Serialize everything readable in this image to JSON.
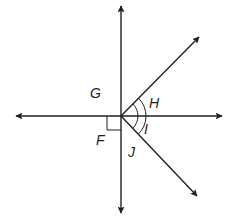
{
  "diagram": {
    "type": "geometry-angles",
    "colors": {
      "line": "#231f20",
      "background": "#ffffff"
    },
    "center": {
      "x": 121,
      "y": 116
    },
    "lines": [
      {
        "name": "vertical-line",
        "from": [
          121,
          5
        ],
        "to": [
          121,
          214
        ],
        "arrows": "both"
      },
      {
        "name": "horizontal-line",
        "from": [
          15,
          116
        ],
        "to": [
          222,
          116
        ],
        "arrows": "both"
      }
    ],
    "rays": [
      {
        "name": "upper-right-ray",
        "from": [
          121,
          116
        ],
        "to": [
          199,
          37
        ],
        "arrow": "end"
      },
      {
        "name": "lower-right-ray",
        "from": [
          121,
          116
        ],
        "to": [
          197,
          196
        ],
        "arrow": "end"
      }
    ],
    "right_angle_marker": {
      "quadrant": "lower-left",
      "size": 14
    },
    "angle_marks": [
      {
        "name": "inner-arc",
        "radius": 17,
        "spans": "upper-ray to lower-ray"
      },
      {
        "name": "outer-arc",
        "radius": 25,
        "spans": "upper-ray to lower-ray"
      }
    ],
    "labels": [
      {
        "id": "G",
        "text": "G",
        "x": 90,
        "y": 86
      },
      {
        "id": "H",
        "text": "H",
        "x": 149,
        "y": 96
      },
      {
        "id": "I",
        "text": "I",
        "x": 143,
        "y": 121
      },
      {
        "id": "F",
        "text": "F",
        "x": 96,
        "y": 133
      },
      {
        "id": "J",
        "text": "J",
        "x": 128,
        "y": 144
      }
    ]
  }
}
